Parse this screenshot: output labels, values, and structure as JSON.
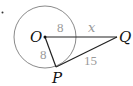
{
  "problem": {
    "bullet": "."
  },
  "diagram": {
    "points": {
      "O": {
        "label": "O",
        "x": 45,
        "y": 37
      },
      "P": {
        "label": "P",
        "x": 56,
        "y": 67
      },
      "Q": {
        "label": "Q",
        "x": 117,
        "y": 37
      }
    },
    "circle": {
      "center": "O",
      "radius": 31
    },
    "segments": [
      {
        "from": "O",
        "to": "Q",
        "label_inside": "8",
        "label_outside": "x"
      },
      {
        "from": "O",
        "to": "P",
        "label": "8"
      },
      {
        "from": "P",
        "to": "Q",
        "label": "15"
      }
    ],
    "labels": {
      "OQ_radius_part": "8",
      "OQ_outside_part": "x",
      "OP": "8",
      "PQ": "15"
    },
    "colors": {
      "circle": "#8a8a8a",
      "segment": "#222222",
      "measure_label": "#9a9a9a",
      "point_label": "#111111"
    }
  }
}
